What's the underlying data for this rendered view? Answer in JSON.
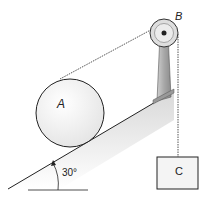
{
  "diagram": {
    "labels": {
      "cylinder": "A",
      "pulley": "B",
      "block": "C",
      "angle": "30°"
    },
    "incline_angle_deg": 30,
    "colors": {
      "stroke": "#222222",
      "fill_light": "#f2f2f2",
      "pulley_fill": "#d9d9d9",
      "post_fill": "#bdbdbd",
      "rope": "#555555"
    }
  }
}
